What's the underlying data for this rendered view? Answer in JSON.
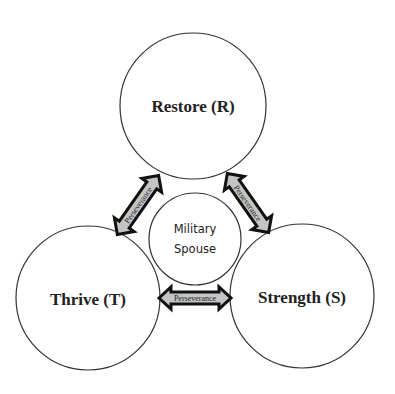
{
  "diagram": {
    "nodes": {
      "restore": {
        "label": "Restore (R)"
      },
      "thrive": {
        "label": "Thrive (T)"
      },
      "strength": {
        "label": "Strength (S)"
      },
      "center": {
        "line1": "Military",
        "line2": "Spouse"
      }
    },
    "connectors": [
      {
        "label": "Perseverance",
        "from": "Thrive (T)",
        "to": "Restore (R)"
      },
      {
        "label": "Perseverance",
        "from": "Restore (R)",
        "to": "Strength (S)"
      },
      {
        "label": "Perseverance",
        "from": "Thrive (T)",
        "to": "Strength (S)"
      }
    ],
    "colors": {
      "arrow_fill": "#c4c4c4",
      "arrow_stroke": "#111111",
      "circle_stroke": "#333333",
      "text": "#222222"
    }
  }
}
